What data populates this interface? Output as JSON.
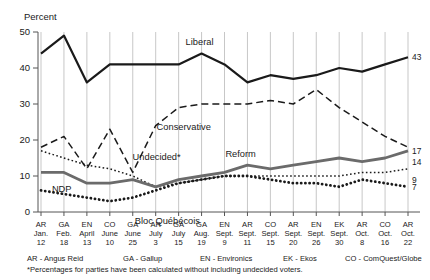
{
  "chart_data": {
    "type": "line",
    "title": "",
    "ylabel": "Percent",
    "xlabel": "",
    "ylim": [
      0,
      50
    ],
    "yticks": [
      0,
      10,
      20,
      30,
      40,
      50
    ],
    "grid": true,
    "legend_position": "inline-annotations",
    "categories": [
      "AR Jan. 12",
      "GA Feb. 18",
      "EN April 13",
      "CO June 10",
      "GA June 25",
      "AR July 3",
      "GA July 15",
      "GA Aug. 19",
      "EN Sept. 9",
      "AR Sept. 11",
      "CO Sept. 15",
      "AR Sept. 20",
      "EN Sept. 26",
      "EK Sept. 30",
      "AR Oct. 8",
      "CO Oct. 16",
      "AR Oct. 22"
    ],
    "x_pollster": [
      "AR",
      "GA",
      "EN",
      "CO",
      "GA",
      "AR",
      "GA",
      "GA",
      "EN",
      "AR",
      "CO",
      "AR",
      "EN",
      "EK",
      "AR",
      "CO",
      "AR"
    ],
    "x_month": [
      "Jan.",
      "Feb.",
      "April",
      "June",
      "June",
      "July",
      "July",
      "Aug.",
      "Sept.",
      "Sept.",
      "Sept.",
      "Sept.",
      "Sept.",
      "Sept.",
      "Oct.",
      "Oct.",
      "Oct."
    ],
    "x_day": [
      "12",
      "18",
      "13",
      "10",
      "25",
      "3",
      "15",
      "19",
      "9",
      "11",
      "15",
      "20",
      "26",
      "30",
      "8",
      "16",
      "22"
    ],
    "series": [
      {
        "name": "Liberal",
        "style": "solid-black",
        "label_x_index": 7,
        "end_value": 43,
        "values": [
          44,
          49,
          36,
          41,
          41,
          41,
          41,
          44,
          41,
          36,
          38,
          37,
          38,
          40,
          39,
          41,
          43
        ]
      },
      {
        "name": "Conservative",
        "style": "dashed-black",
        "label_x_index": 6,
        "end_value": 14,
        "values": [
          18,
          21,
          12,
          23,
          11,
          24,
          29,
          30,
          30,
          30,
          31,
          30,
          34,
          29,
          25,
          21,
          18
        ]
      },
      {
        "name": "Undecided*",
        "style": "dashed-black-thin",
        "label_x_index": 6,
        "end_value": null,
        "values": [
          18,
          21,
          12,
          23,
          11,
          24,
          29,
          30,
          30,
          30,
          31,
          30,
          34,
          29,
          25,
          21,
          18
        ]
      },
      {
        "name": "NDP",
        "style": "dotted-thin",
        "label_x_index": 1,
        "end_value": 9,
        "values": [
          17,
          15,
          13,
          12,
          10,
          7,
          8,
          9,
          10,
          10,
          10,
          10,
          10,
          10,
          11,
          11,
          12
        ]
      },
      {
        "name": "Reform",
        "style": "solid-gray-thick",
        "label_x_index": 9,
        "end_value": 17,
        "values": [
          11,
          11,
          8,
          8,
          9,
          7,
          9,
          10,
          11,
          13,
          12,
          13,
          14,
          15,
          14,
          15,
          17
        ]
      },
      {
        "name": "Bloc Québécois",
        "style": "dotted-thick",
        "label_x_index": 4,
        "end_value": 7,
        "values": [
          6,
          5,
          4,
          3,
          4,
          6,
          8,
          9,
          10,
          10,
          9,
          8,
          8,
          7,
          9,
          8,
          7
        ]
      }
    ],
    "end_labels": [
      {
        "text": "43",
        "value": 43
      },
      {
        "text": "17",
        "value": 17
      },
      {
        "text": "14",
        "value": 14
      },
      {
        "text": "9",
        "value": 9
      },
      {
        "text": "7",
        "value": 7
      }
    ],
    "legend": [
      "AR - Angus Reid",
      "GA - Gallup",
      "EN - Environics",
      "EK - Ekos",
      "CO - ComQuest/Globe"
    ],
    "footnote": "*Percentages for parties have been calculated without including undecided voters."
  },
  "colors": {
    "liberal": "#1a1a1a",
    "conservative": "#1a1a1a",
    "undecided": "#1a1a1a",
    "ndp": "#1a1a1a",
    "reform": "#6b6b6b",
    "bloc": "#1a1a1a",
    "grid": "#b9b9b9",
    "axis": "#555555",
    "background": "#ffffff"
  }
}
